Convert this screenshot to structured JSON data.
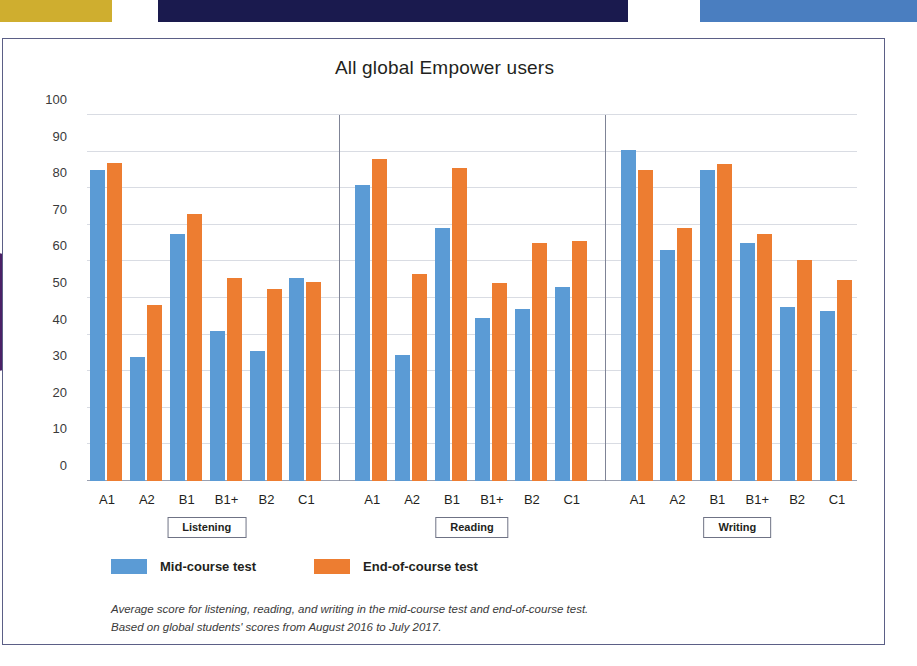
{
  "decor": {
    "banner_gold_color": "#cfae2f",
    "banner_navy_color": "#1a1a4e",
    "banner_blue_color": "#4a7ec0",
    "disc_color": "#4b2066"
  },
  "chart_data": {
    "type": "bar",
    "title": "All global Empower users",
    "xlabel": "",
    "ylabel": "",
    "ylim": [
      0,
      100
    ],
    "ytick_step": 10,
    "yticks": [
      "100",
      "90",
      "80",
      "70",
      "60",
      "50",
      "40",
      "30",
      "20",
      "10",
      "0"
    ],
    "grid": true,
    "legend_position": "bottom-left",
    "categories": [
      "A1",
      "A2",
      "B1",
      "B1+",
      "B2",
      "C1"
    ],
    "groups": [
      {
        "name": "Listening",
        "series": [
          {
            "name": "Mid-course test",
            "values": [
              85,
              34,
              67.5,
              41,
              35.5,
              55.5
            ]
          },
          {
            "name": "End-of-course test",
            "values": [
              87,
              48,
              73,
              55.5,
              52.5,
              54.5
            ]
          }
        ]
      },
      {
        "name": "Reading",
        "series": [
          {
            "name": "Mid-course test",
            "values": [
              81,
              34.5,
              69,
              44.5,
              47,
              53
            ]
          },
          {
            "name": "End-of-course test",
            "values": [
              88,
              56.5,
              85.5,
              54,
              65,
              65.5
            ]
          }
        ]
      },
      {
        "name": "Writing",
        "series": [
          {
            "name": "Mid-course test",
            "values": [
              90.5,
              63,
              85,
              65,
              47.5,
              46.5
            ]
          },
          {
            "name": "End-of-course test",
            "values": [
              85,
              69,
              86.5,
              67.5,
              60.5,
              55
            ]
          }
        ]
      }
    ],
    "series_colors": {
      "Mid-course test": "#5b9bd5",
      "End-of-course test": "#ed7d31"
    },
    "legend": [
      {
        "label": "Mid-course test",
        "color": "#5b9bd5"
      },
      {
        "label": "End-of-course test",
        "color": "#ed7d31"
      }
    ],
    "footnote_line1": "Average score for listening, reading, and writing in the mid-course test and end-of-course test.",
    "footnote_line2": "Based on global students' scores from August 2016 to July 2017."
  }
}
